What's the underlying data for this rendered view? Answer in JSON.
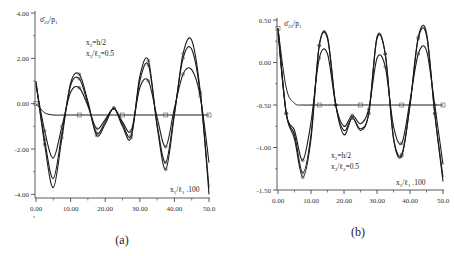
{
  "chart_data": [
    {
      "panel": "(a)",
      "type": "line",
      "ylabel": "σ̄22/p1",
      "xlabel": "x1/ℓ1 .100",
      "annotation": [
        "x2=h/2",
        "x3/ℓ3=0.5"
      ],
      "xlim": [
        0,
        50
      ],
      "ylim": [
        -5,
        4
      ],
      "yticks": [
        "4.00",
        "2.00",
        "0.00",
        "-2.00",
        "-4.00"
      ],
      "xticks": [
        "0.00",
        "10.00",
        "20.00",
        "30.00",
        "40.00",
        "50.0"
      ],
      "grid": false,
      "x": [
        0,
        2.5,
        5,
        7.5,
        10,
        12.5,
        15,
        17.5,
        20,
        22.5,
        25,
        27.5,
        30,
        32.5,
        35,
        37.5,
        40,
        42.5,
        45,
        47.5,
        50
      ],
      "series": [
        {
          "name": "curve-1 (largest)",
          "values": [
            1.0,
            -1.8,
            -3.7,
            -1.5,
            0.9,
            1.3,
            0.1,
            -1.4,
            -0.9,
            -0.2,
            -1.0,
            -1.5,
            1.2,
            1.9,
            -1.0,
            -2.9,
            -0.5,
            2.2,
            2.8,
            0.5,
            -4.0
          ]
        },
        {
          "name": "curve-2",
          "values": [
            0.9,
            -1.6,
            -3.3,
            -1.3,
            0.8,
            1.1,
            0.0,
            -1.3,
            -0.8,
            -0.2,
            -0.9,
            -1.4,
            1.0,
            1.7,
            -0.9,
            -2.6,
            -0.4,
            2.0,
            2.4,
            0.4,
            -3.7
          ]
        },
        {
          "name": "curve-3 (smallest)",
          "values": [
            0.8,
            -1.2,
            -2.4,
            -1.0,
            0.5,
            0.7,
            -0.1,
            -1.1,
            -0.7,
            -0.2,
            -0.8,
            -1.2,
            0.7,
            1.0,
            -0.6,
            -1.9,
            -0.2,
            1.3,
            1.5,
            0.3,
            -2.6
          ]
        },
        {
          "name": "reference (decaying)",
          "values": [
            0.0,
            -0.4,
            -0.5,
            -0.5,
            -0.5,
            -0.5,
            -0.5,
            -0.5,
            -0.5,
            -0.5,
            -0.5,
            -0.5,
            -0.5,
            -0.5,
            -0.5,
            -0.5,
            -0.5,
            -0.5,
            -0.5,
            -0.5,
            -0.5
          ]
        }
      ]
    },
    {
      "panel": "(b)",
      "type": "line",
      "ylabel": "σ̄22/p1",
      "xlabel": "x1/ℓ1 .100",
      "annotation": [
        "x2=h/2",
        "x3/ℓ3=0.5"
      ],
      "xlim": [
        0,
        50
      ],
      "ylim": [
        -1.5,
        0.5
      ],
      "yticks": [
        "0.50",
        "0.00",
        "-0.50",
        "-1.00",
        "-1.50"
      ],
      "xticks": [
        "0.00",
        "10.00",
        "20.00",
        "30.00",
        "40.00",
        "50.0"
      ],
      "grid": false,
      "x": [
        0,
        2.5,
        5,
        7.5,
        10,
        12.5,
        15,
        17.5,
        20,
        22.5,
        25,
        27.5,
        30,
        32.5,
        35,
        37.5,
        40,
        42.5,
        45,
        47.5,
        50
      ],
      "series": [
        {
          "name": "curve-1 (largest)",
          "values": [
            0.4,
            -0.6,
            -0.9,
            -1.35,
            -0.9,
            0.2,
            0.3,
            -0.5,
            -0.85,
            -0.65,
            -0.8,
            -0.6,
            0.3,
            0.1,
            -0.9,
            -1.1,
            -0.5,
            0.3,
            0.35,
            -0.6,
            -1.4
          ]
        },
        {
          "name": "curve-2",
          "values": [
            0.4,
            -0.6,
            -0.85,
            -1.3,
            -0.85,
            0.2,
            0.28,
            -0.5,
            -0.8,
            -0.65,
            -0.78,
            -0.6,
            0.28,
            0.1,
            -0.88,
            -1.08,
            -0.5,
            0.28,
            0.32,
            -0.6,
            -1.35
          ]
        },
        {
          "name": "curve-3 (smallest)",
          "values": [
            0.35,
            -0.6,
            -0.8,
            -1.15,
            -0.7,
            0.05,
            0.1,
            -0.5,
            -0.75,
            -0.62,
            -0.72,
            -0.55,
            0.05,
            -0.05,
            -0.75,
            -0.95,
            -0.45,
            0.1,
            0.14,
            -0.5,
            -1.2
          ]
        },
        {
          "name": "reference (decaying)",
          "values": [
            0.4,
            -0.3,
            -0.48,
            -0.5,
            -0.5,
            -0.5,
            -0.5,
            -0.5,
            -0.5,
            -0.5,
            -0.5,
            -0.5,
            -0.5,
            -0.5,
            -0.5,
            -0.5,
            -0.5,
            -0.5,
            -0.5,
            -0.5,
            -0.5
          ]
        }
      ]
    }
  ],
  "captions": {
    "a": "(a)",
    "b": "(b)"
  }
}
